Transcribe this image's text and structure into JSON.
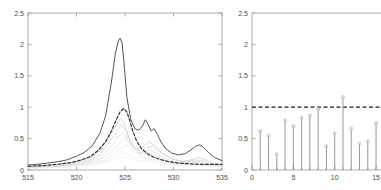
{
  "figure": {
    "title": "",
    "background": "#ffffff",
    "axis_color": "#9a9a9a",
    "panel_count": 2
  },
  "chart_data": [
    {
      "type": "line",
      "panel": "left",
      "title": "",
      "xlabel": "",
      "ylabel": "",
      "xlim": [
        515,
        535
      ],
      "ylim": [
        0,
        2.5
      ],
      "xticks": [
        515,
        520,
        525,
        530,
        535
      ],
      "xticklabels": [
        "515",
        "520",
        "525",
        "530",
        "535"
      ],
      "yticks": [
        0,
        0.5,
        1,
        1.5,
        2,
        2.5
      ],
      "yticklabels": [
        "0",
        "0.5",
        "1",
        "1.5",
        "2",
        "2.5"
      ],
      "grid": false,
      "legend": "none",
      "series": [
        {
          "name": "solid-dark-spectrum",
          "style": "solid",
          "color": "#555555",
          "width": 1.0,
          "x": [
            515.0,
            516.0,
            517.0,
            518.0,
            519.0,
            520.0,
            520.8,
            521.6,
            522.4,
            523.0,
            523.6,
            524.0,
            524.3,
            524.5,
            524.7,
            524.9,
            525.2,
            525.6,
            526.0,
            526.4,
            526.8,
            527.1,
            527.4,
            527.7,
            528.0,
            528.3,
            528.7,
            529.2,
            529.8,
            530.5,
            531.2,
            531.8,
            532.3,
            532.7,
            533.1,
            533.6,
            534.2,
            535.0
          ],
          "y": [
            0.08,
            0.09,
            0.11,
            0.13,
            0.16,
            0.22,
            0.28,
            0.38,
            0.58,
            0.86,
            1.4,
            1.85,
            2.05,
            2.1,
            2.02,
            1.7,
            1.15,
            0.8,
            0.66,
            0.63,
            0.7,
            0.8,
            0.72,
            0.62,
            0.66,
            0.58,
            0.45,
            0.34,
            0.27,
            0.24,
            0.26,
            0.32,
            0.38,
            0.4,
            0.36,
            0.28,
            0.2,
            0.15
          ]
        },
        {
          "name": "dashed-dark-reference",
          "style": "dashed",
          "color": "#333333",
          "width": 1.2,
          "x": [
            515.0,
            516.5,
            518.0,
            519.5,
            520.5,
            521.5,
            522.3,
            523.0,
            523.6,
            524.1,
            524.5,
            524.9,
            525.2,
            525.5,
            525.8,
            526.2,
            526.7,
            527.3,
            528.0,
            528.8,
            529.6,
            530.5,
            531.5,
            532.5,
            533.5,
            534.2,
            535.0
          ],
          "y": [
            0.06,
            0.07,
            0.09,
            0.12,
            0.16,
            0.22,
            0.32,
            0.45,
            0.62,
            0.8,
            0.93,
            0.98,
            0.92,
            0.78,
            0.62,
            0.46,
            0.34,
            0.26,
            0.2,
            0.16,
            0.13,
            0.11,
            0.1,
            0.09,
            0.09,
            0.09,
            0.09
          ]
        },
        {
          "name": "faint-ensemble-1",
          "style": "solid",
          "color": "#c8c8c8",
          "width": 0.7,
          "x": [
            515,
            518,
            520,
            521.5,
            522.5,
            523.3,
            524.0,
            524.5,
            524.9,
            525.3,
            525.8,
            526.3,
            526.9,
            527.4,
            528.0,
            528.8,
            529.8,
            530.8,
            531.8,
            532.5,
            533.2,
            534.0,
            535.0
          ],
          "y": [
            0.05,
            0.07,
            0.13,
            0.2,
            0.32,
            0.5,
            0.68,
            0.82,
            0.76,
            0.56,
            0.4,
            0.33,
            0.38,
            0.45,
            0.4,
            0.28,
            0.18,
            0.14,
            0.16,
            0.2,
            0.17,
            0.11,
            0.08
          ]
        },
        {
          "name": "faint-ensemble-2",
          "style": "solid",
          "color": "#d2d2d2",
          "width": 0.7,
          "x": [
            515,
            518,
            520,
            521.5,
            522.5,
            523.3,
            524.1,
            524.6,
            525.0,
            525.5,
            526.0,
            526.6,
            527.2,
            527.8,
            528.5,
            529.4,
            530.4,
            531.4,
            532.3,
            533.0,
            533.8,
            535.0
          ],
          "y": [
            0.05,
            0.06,
            0.11,
            0.17,
            0.27,
            0.42,
            0.6,
            0.72,
            0.64,
            0.46,
            0.34,
            0.3,
            0.36,
            0.38,
            0.3,
            0.21,
            0.15,
            0.13,
            0.16,
            0.15,
            0.1,
            0.07
          ]
        },
        {
          "name": "faint-ensemble-3",
          "style": "solid",
          "color": "#d8d8d8",
          "width": 0.7,
          "x": [
            515,
            518,
            520,
            521.6,
            522.7,
            523.5,
            524.2,
            524.8,
            525.3,
            525.9,
            526.5,
            527.1,
            527.7,
            528.4,
            529.2,
            530.2,
            531.2,
            532.1,
            532.9,
            533.8,
            535.0
          ],
          "y": [
            0.04,
            0.06,
            0.1,
            0.15,
            0.24,
            0.36,
            0.52,
            0.6,
            0.48,
            0.35,
            0.27,
            0.3,
            0.32,
            0.25,
            0.18,
            0.13,
            0.12,
            0.14,
            0.13,
            0.09,
            0.07
          ]
        },
        {
          "name": "faint-ensemble-4",
          "style": "solid",
          "color": "#dedede",
          "width": 0.7,
          "x": [
            515,
            518,
            520,
            521.7,
            522.8,
            523.7,
            524.4,
            525.0,
            525.6,
            526.2,
            526.9,
            527.5,
            528.2,
            529.0,
            530.0,
            531.0,
            532.0,
            532.8,
            533.7,
            535.0
          ],
          "y": [
            0.04,
            0.05,
            0.09,
            0.13,
            0.2,
            0.3,
            0.42,
            0.5,
            0.38,
            0.28,
            0.26,
            0.27,
            0.21,
            0.15,
            0.12,
            0.11,
            0.13,
            0.12,
            0.08,
            0.06
          ]
        },
        {
          "name": "faint-ensemble-5",
          "style": "solid",
          "color": "#e4e4e4",
          "width": 0.7,
          "x": [
            515,
            518,
            520,
            521.8,
            523.0,
            523.9,
            524.6,
            525.2,
            525.8,
            526.5,
            527.2,
            527.9,
            528.7,
            529.6,
            530.6,
            531.6,
            532.5,
            533.4,
            535.0
          ],
          "y": [
            0.03,
            0.05,
            0.08,
            0.11,
            0.17,
            0.25,
            0.35,
            0.4,
            0.3,
            0.23,
            0.23,
            0.22,
            0.17,
            0.12,
            0.1,
            0.11,
            0.11,
            0.08,
            0.05
          ]
        },
        {
          "name": "faint-ensemble-6",
          "style": "solid",
          "color": "#eaeaea",
          "width": 0.7,
          "x": [
            515,
            518,
            520,
            522.0,
            523.2,
            524.1,
            524.8,
            525.4,
            526.1,
            526.8,
            527.6,
            528.4,
            529.3,
            530.3,
            531.3,
            532.2,
            533.1,
            535.0
          ],
          "y": [
            0.03,
            0.04,
            0.07,
            0.1,
            0.15,
            0.22,
            0.28,
            0.24,
            0.19,
            0.2,
            0.18,
            0.14,
            0.1,
            0.09,
            0.09,
            0.1,
            0.07,
            0.05
          ]
        },
        {
          "name": "faint-ensemble-7",
          "style": "solid",
          "color": "#efefef",
          "width": 0.7,
          "x": [
            515,
            518,
            520,
            522.2,
            523.4,
            524.3,
            525.0,
            525.7,
            526.4,
            527.2,
            528.0,
            528.9,
            529.9,
            530.9,
            531.9,
            532.8,
            535.0
          ],
          "y": [
            0.03,
            0.04,
            0.06,
            0.09,
            0.13,
            0.18,
            0.21,
            0.17,
            0.15,
            0.16,
            0.14,
            0.11,
            0.08,
            0.08,
            0.08,
            0.07,
            0.04
          ]
        }
      ]
    },
    {
      "type": "stem",
      "panel": "right",
      "title": "",
      "xlabel": "",
      "ylabel": "",
      "xlim": [
        0,
        15.6
      ],
      "ylim": [
        0,
        2.5
      ],
      "xticks": [
        0,
        5,
        10,
        15
      ],
      "xticklabels": [
        "0",
        "5",
        "10",
        "15"
      ],
      "xticks_minor": [
        1,
        2,
        3,
        4,
        6,
        7,
        8,
        9,
        11,
        12,
        13,
        14
      ],
      "yticks": [
        0,
        0.5,
        1,
        1.5,
        2,
        2.5
      ],
      "yticklabels": [
        "0",
        "0.5",
        "1",
        "1.5",
        "2",
        "2.5"
      ],
      "grid": false,
      "legend": "none",
      "stem_color": "#8c8c8c",
      "marker_color": "#bdbdbd",
      "threshold": {
        "value": 1.0,
        "style": "dashed",
        "color": "#1a1a1a",
        "label": ""
      },
      "x": [
        1,
        2,
        3,
        4,
        5,
        6,
        7,
        8,
        9,
        10,
        11,
        12,
        13,
        14,
        15
      ],
      "values": [
        0.62,
        0.55,
        0.25,
        0.79,
        0.7,
        0.83,
        0.87,
        0.97,
        0.38,
        0.59,
        1.16,
        0.66,
        0.42,
        0.46,
        0.75
      ]
    }
  ]
}
